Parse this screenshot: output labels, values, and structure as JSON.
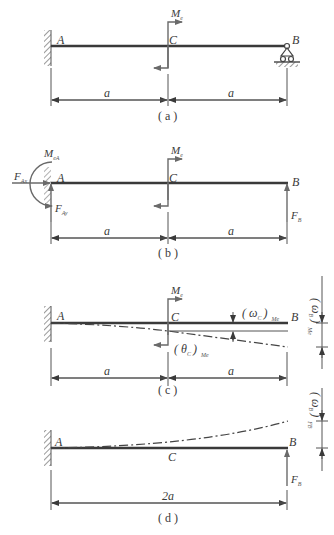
{
  "figure": {
    "panels": [
      {
        "id": "a",
        "caption": "( a )",
        "labels": {
          "A": "A",
          "B": "B",
          "C": "C",
          "moment": "M",
          "moment_sub": "e"
        },
        "dims": [
          "a",
          "a"
        ],
        "supports": {
          "A": "fixed",
          "B": "roller"
        }
      },
      {
        "id": "b",
        "caption": "( b )",
        "labels": {
          "A": "A",
          "B": "B",
          "C": "C",
          "moment": "M",
          "moment_sub": "e",
          "reaction_moment": "M",
          "reaction_moment_sub": "eA",
          "FAx": "F",
          "FAx_sub": "Ax",
          "FAy": "F",
          "FAy_sub": "Ay",
          "FB": "F",
          "FB_sub": "B"
        },
        "dims": [
          "a",
          "a"
        ]
      },
      {
        "id": "c",
        "caption": "( c )",
        "labels": {
          "A": "A",
          "B": "B",
          "C": "C",
          "moment": "M",
          "moment_sub": "e",
          "wC": "( ω",
          "wC_sub": "C",
          "wC_close": ")",
          "wC_tail": "Me",
          "thetaC": "( θ",
          "thetaC_sub": "C",
          "thetaC_close": ")",
          "thetaC_tail": "Me",
          "wB": "( ω",
          "wB_sub": "B",
          "wB_close": ")",
          "wB_tail": "Me"
        },
        "dims": [
          "a",
          "a"
        ]
      },
      {
        "id": "d",
        "caption": "( d )",
        "labels": {
          "A": "A",
          "B": "B",
          "C": "C",
          "FB": "F",
          "FB_sub": "B",
          "wB": "( ω",
          "wB_sub": "B",
          "wB_close": ")",
          "wB_tail": "FB"
        },
        "dims": [
          "2a"
        ]
      }
    ]
  }
}
